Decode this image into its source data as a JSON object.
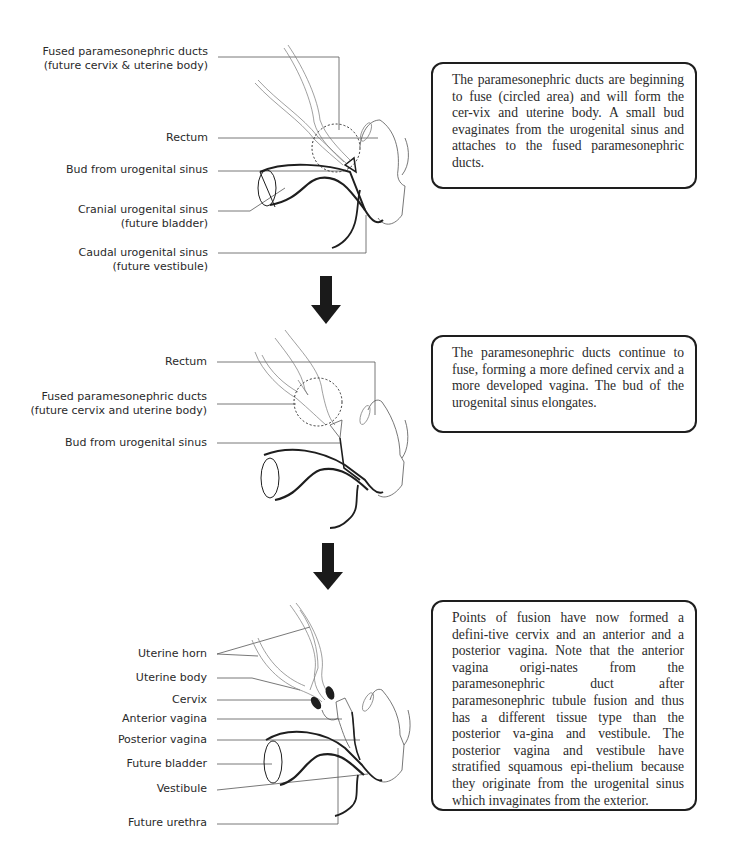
{
  "stage1": {
    "labels": {
      "fused_ducts_line1": "Fused paramesonephric ducts",
      "fused_ducts_line2": "(future cervix & uterine body)",
      "rectum": "Rectum",
      "bud": "Bud from urogenital sinus",
      "cranial_line1": "Cranial urogenital sinus",
      "cranial_line2": "(future bladder)",
      "caudal_line1": "Caudal urogenital sinus",
      "caudal_line2": "(future vestibule)"
    },
    "description": "The paramesonephric ducts are beginning to fuse (circled area) and will form the cer-­vix and uterine body.  A small bud evaginates from the urogenital sinus and attaches to the fused paramesonephric ducts."
  },
  "stage2": {
    "labels": {
      "rectum": "Rectum",
      "fused_ducts_line1": "Fused paramesonephric ducts",
      "fused_ducts_line2": "(future cervix and uterine body)",
      "bud": "Bud from urogenital sinus"
    },
    "description": "The paramesonephric ducts continue to fuse, forming a more defined cervix and a more developed vagina.  The bud of the urogenital sinus elongates."
  },
  "stage3": {
    "labels": {
      "uterine_horn": "Uterine horn",
      "uterine_body": "Uterine body",
      "cervix": "Cervix",
      "anterior_vagina": "Anterior vagina",
      "posterior_vagina": "Posterior vagina",
      "future_bladder": "Future bladder",
      "vestibule": "Vestibule",
      "future_urethra": "Future urethra"
    },
    "description": "Points of fusion have now formed a defini-­tive cervix and an anterior and a posterior vagina.  Note that the anterior vagina origi-­nates from the paramesonephric duct after paramesonephric tubule fusion and thus has a different tissue type than the posterior va-­gina and vestibule.  The posterior vagina and vestibule have stratified squamous epi-­thelium because they originate from the urogenital sinus which invaginates from the exterior."
  },
  "arrows": [
    {
      "icon": "down-arrow-icon"
    },
    {
      "icon": "down-arrow-icon"
    }
  ],
  "colors": {
    "ink": "#1e1e1e",
    "text": "#2a2a2a",
    "leader": "#555555",
    "background": "#ffffff"
  }
}
